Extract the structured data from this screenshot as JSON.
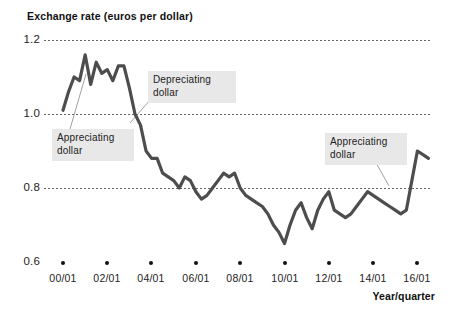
{
  "chart_data": {
    "type": "line",
    "title": "Exchange rate (euros per dollar)",
    "xlabel": "Year/quarter",
    "ylabel": "",
    "ylim": [
      0.6,
      1.2
    ],
    "yticks": [
      1.2,
      1.0,
      0.8,
      0.6
    ],
    "ytick_labels": [
      "1.2",
      "1.0",
      "0.8",
      "0.6"
    ],
    "grid": "horizontal-dotted",
    "legend": "none",
    "xticks": [
      0,
      8,
      16,
      24,
      32,
      40,
      48,
      56,
      64
    ],
    "xtick_labels": [
      "00/01",
      "02/01",
      "04/01",
      "06/01",
      "08/01",
      "10/01",
      "12/01",
      "14/01",
      "16/01"
    ],
    "x_unit": "quarter index from 2000 Q1",
    "series": [
      {
        "name": "Exchange rate (euros per dollar)",
        "color": "#4d4d4d",
        "x": [
          0,
          1,
          2,
          3,
          4,
          5,
          6,
          7,
          8,
          9,
          10,
          11,
          12,
          13,
          14,
          15,
          16,
          17,
          18,
          19,
          20,
          21,
          22,
          23,
          24,
          25,
          26,
          27,
          28,
          29,
          30,
          31,
          32,
          33,
          34,
          35,
          36,
          37,
          38,
          39,
          40,
          41,
          42,
          43,
          44,
          45,
          46,
          47,
          48,
          49,
          50,
          51,
          52,
          53,
          54,
          55,
          56,
          57,
          58,
          59,
          60,
          61,
          62,
          63,
          64,
          65,
          66
        ],
        "values": [
          1.01,
          1.06,
          1.1,
          1.09,
          1.16,
          1.08,
          1.14,
          1.11,
          1.12,
          1.09,
          1.13,
          1.13,
          1.07,
          1.0,
          0.97,
          0.9,
          0.88,
          0.88,
          0.84,
          0.83,
          0.82,
          0.8,
          0.83,
          0.82,
          0.79,
          0.77,
          0.78,
          0.8,
          0.82,
          0.84,
          0.83,
          0.84,
          0.8,
          0.78,
          0.77,
          0.76,
          0.75,
          0.73,
          0.7,
          0.68,
          0.65,
          0.7,
          0.74,
          0.76,
          0.72,
          0.69,
          0.74,
          0.77,
          0.79,
          0.74,
          0.73,
          0.72,
          0.73,
          0.75,
          0.77,
          0.79,
          0.78,
          0.77,
          0.76,
          0.75,
          0.74,
          0.73,
          0.74,
          0.82,
          0.9,
          0.89,
          0.88
        ]
      }
    ],
    "annotations": [
      {
        "id": "appreciating-dollar-1",
        "text": "Appreciating\ndollar",
        "box_x": 52,
        "box_y": 129,
        "pointer_to_x": 86,
        "pointer_to_y": 74
      },
      {
        "id": "depreciating-dollar",
        "text": "Depreciating\ndollar",
        "box_x": 148,
        "box_y": 71,
        "pointer_to_x": 130,
        "pointer_to_y": 123
      },
      {
        "id": "appreciating-dollar-2",
        "text": "Appreciating\ndollar",
        "box_x": 325,
        "box_y": 133,
        "pointer_to_x": 389,
        "pointer_to_y": 185
      }
    ]
  }
}
